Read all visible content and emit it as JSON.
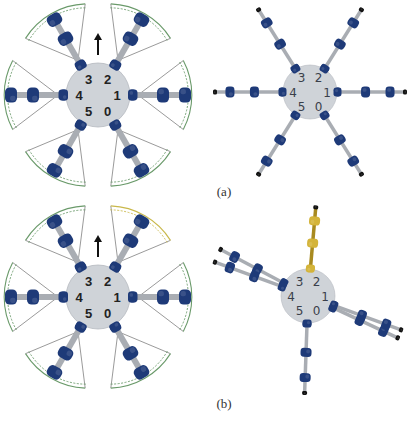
{
  "figure": {
    "colors": {
      "body": "#cfd3d8",
      "body_stroke": "#b5b9bf",
      "joint": "#1e3a78",
      "joint_dark": "#152a5a",
      "link": "#a9adb3",
      "arc": "#6a9a6a",
      "arc_yellow": "#c9b84a",
      "gold": "#d4b43a",
      "gold_dark": "#a88a20",
      "label": "#222222",
      "label3d": "#3a3f4a",
      "arrow": "#111111"
    },
    "rows": [
      {
        "caption": "(a)",
        "caption_pos": [
          224,
          184
        ],
        "schematic": {
          "center": [
            98,
            95
          ],
          "radius": 32,
          "arrow": true,
          "legs": [
            {
              "id": "0",
              "angle": 60,
              "label_offset": [
                12,
                16
              ]
            },
            {
              "id": "1",
              "angle": 0,
              "label_offset": [
                20,
                5
              ]
            },
            {
              "id": "2",
              "angle": -60,
              "label_offset": [
                12,
                -6
              ]
            },
            {
              "id": "3",
              "angle": -120,
              "label_offset": [
                -12,
                -6
              ]
            },
            {
              "id": "4",
              "angle": 180,
              "label_offset": [
                -20,
                5
              ]
            },
            {
              "id": "5",
              "angle": 120,
              "label_offset": [
                -12,
                16
              ]
            }
          ]
        },
        "render3d": {
          "center": [
            310,
            92
          ],
          "radius": 27,
          "legs": [
            {
              "id": "0",
              "angle": 58,
              "length": 70,
              "color": "blue"
            },
            {
              "id": "1",
              "angle": 0,
              "length": 68,
              "color": "blue"
            },
            {
              "id": "2",
              "angle": -58,
              "length": 70,
              "color": "blue"
            },
            {
              "id": "3",
              "angle": -122,
              "length": 70,
              "color": "blue"
            },
            {
              "id": "4",
              "angle": 180,
              "length": 68,
              "color": "blue"
            },
            {
              "id": "5",
              "angle": 122,
              "length": 70,
              "color": "blue"
            }
          ]
        }
      },
      {
        "caption": "(b)",
        "caption_pos": [
          224,
          396
        ],
        "schematic": {
          "center": [
            98,
            297
          ],
          "radius": 32,
          "arrow": true,
          "legs": [
            {
              "id": "0",
              "angle": 60,
              "label_offset": [
                12,
                16
              ]
            },
            {
              "id": "1",
              "angle": 0,
              "label_offset": [
                20,
                5
              ]
            },
            {
              "id": "2",
              "angle": -60,
              "label_offset": [
                12,
                -6
              ],
              "highlight": true
            },
            {
              "id": "3",
              "angle": -120,
              "label_offset": [
                -12,
                -6
              ]
            },
            {
              "id": "4",
              "angle": 180,
              "label_offset": [
                -20,
                5
              ]
            },
            {
              "id": "5",
              "angle": 120,
              "label_offset": [
                -12,
                16
              ]
            }
          ]
        },
        "render3d": {
          "center": [
            308,
            296
          ],
          "radius": 27,
          "legs": [
            {
              "id": "0",
              "angle": 25,
              "length": 72,
              "color": "blue"
            },
            {
              "id": "1",
              "angle": 20,
              "length": 72,
              "color": "blue"
            },
            {
              "id": "2",
              "angle": -85,
              "length": 62,
              "color": "gold"
            },
            {
              "id": "3",
              "angle": -152,
              "length": 72,
              "color": "blue"
            },
            {
              "id": "4",
              "angle": -160,
              "length": 72,
              "color": "blue"
            },
            {
              "id": "5",
              "angle": 92,
              "length": 70,
              "color": "blue"
            }
          ]
        }
      }
    ]
  }
}
